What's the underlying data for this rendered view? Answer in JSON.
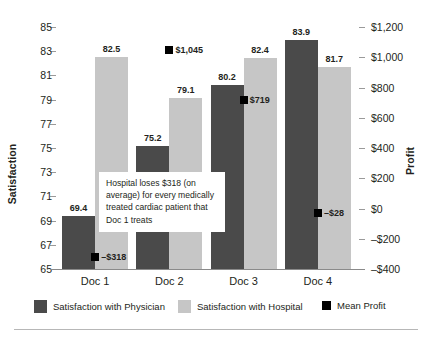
{
  "chart_data": {
    "type": "bar",
    "title": "",
    "categories": [
      "Doc 1",
      "Doc 2",
      "Doc 3",
      "Doc 4"
    ],
    "series": [
      {
        "name": "Satisfaction with Physician",
        "axis": "left",
        "color": "#4a4a4a",
        "values": [
          69.4,
          75.2,
          80.2,
          83.9
        ],
        "labels": [
          "69.4",
          "75.2",
          "80.2",
          "83.9"
        ]
      },
      {
        "name": "Satisfaction with Hospital",
        "axis": "left",
        "color": "#c6c6c6",
        "values": [
          82.5,
          79.1,
          82.4,
          81.7
        ],
        "labels": [
          "82.5",
          "79.1",
          "82.4",
          "81.7"
        ]
      },
      {
        "name": "Mean Profit",
        "axis": "right",
        "type": "marker",
        "color": "#000000",
        "values": [
          -318,
          1045,
          719,
          -28
        ],
        "labels": [
          "–$318",
          "$1,045",
          "$719",
          "–$28"
        ]
      }
    ],
    "xlabel": "",
    "ylabel": "Satisfaction",
    "y2label": "Profit",
    "ylim": [
      65,
      85
    ],
    "y2lim": [
      -400,
      1200
    ],
    "yticks": [
      65,
      67,
      69,
      71,
      73,
      75,
      77,
      79,
      81,
      83,
      85
    ],
    "ytick_labels": [
      "65",
      "67",
      "69",
      "71",
      "73",
      "75",
      "77",
      "79",
      "81",
      "83",
      "85"
    ],
    "y2ticks": [
      -400,
      -200,
      0,
      200,
      400,
      600,
      800,
      1000,
      1200
    ],
    "y2tick_labels": [
      "–$400",
      "–$200",
      "$0",
      "$200",
      "$400",
      "$600",
      "$800",
      "$1,000",
      "$1,200"
    ],
    "grid": false,
    "legend_position": "bottom",
    "annotations": [
      {
        "name": "hospital-loss-callout",
        "text": "Hospital loses $318 (on average) for every medically treated cardiac patient that Doc 1 treats"
      }
    ]
  },
  "axes": {
    "left_title": "Satisfaction",
    "right_title": "Profit"
  },
  "legend": {
    "items": [
      {
        "label": "Satisfaction with Physician",
        "color": "#4a4a4a"
      },
      {
        "label": "Satisfaction with Hospital",
        "color": "#c6c6c6"
      },
      {
        "label": "Mean Profit",
        "color": "#000000"
      }
    ]
  },
  "annotation": {
    "text": "Hospital loses $318 (on average) for every medically treated cardiac patient that Doc 1 treats"
  }
}
